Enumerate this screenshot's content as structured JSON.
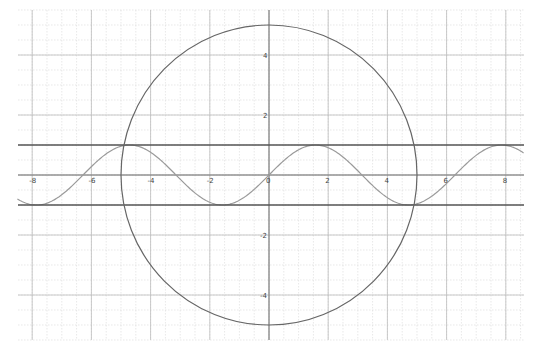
{
  "chart_data": {
    "type": "line",
    "title": "",
    "xlabel": "",
    "ylabel": "",
    "xlim": [
      -8.5,
      8.6
    ],
    "ylim": [
      -5.5,
      5.6
    ],
    "grid": true,
    "grid_major_step": 2,
    "grid_minor_step": 0.5,
    "x_ticks": [
      -8,
      -6,
      -4,
      -2,
      0,
      2,
      4,
      6,
      8
    ],
    "x_tick_labels": [
      "-8",
      "-6",
      "-4",
      "-2",
      "0",
      "2",
      "4",
      "6",
      "8"
    ],
    "y_ticks": [
      -4,
      -2,
      2,
      4
    ],
    "y_tick_labels": [
      "-4",
      "-2",
      "2",
      "4"
    ],
    "series": [
      {
        "name": "y = sin(x)",
        "kind": "function",
        "expr": "sin",
        "color": "#9a9a9a",
        "x_range": [
          -8.5,
          8.6
        ]
      },
      {
        "name": "y = 1",
        "kind": "hline",
        "value": 1,
        "color": "#555555"
      },
      {
        "name": "y = -1",
        "kind": "hline",
        "value": -1,
        "color": "#555555"
      },
      {
        "name": "x^2 + y^2 = 25",
        "kind": "circle",
        "center": [
          0,
          0
        ],
        "radius": 5,
        "color": "#666666"
      }
    ],
    "legend": null
  },
  "layout": {
    "origin_px": [
      269,
      175
    ],
    "px_per_unit_x": 29.6,
    "px_per_unit_y": 30,
    "plot_bounds_px": {
      "left": 18,
      "right": 524,
      "top": 10,
      "bottom": 340
    }
  }
}
